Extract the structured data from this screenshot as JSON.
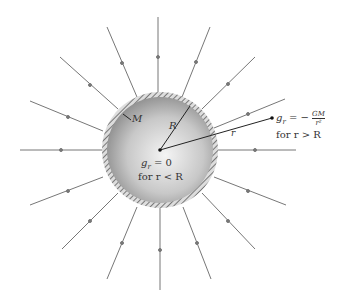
{
  "figure": {
    "labels": {
      "mass": "M",
      "radius": "R",
      "distance": "r",
      "inside_eq": "g",
      "inside_sub": "r",
      "inside_val": " = 0",
      "inside_cond": "for r < R",
      "outside_g": "g",
      "outside_sub": "r",
      "outside_eq": " = −",
      "outside_num": "GM",
      "outside_den": "r²",
      "outside_cond": "for r > R"
    },
    "colors": {
      "line": "#777777",
      "shell": "#888888",
      "text": "#333333"
    },
    "sphere": {
      "cx": 160,
      "cy": 150,
      "r": 58
    }
  }
}
